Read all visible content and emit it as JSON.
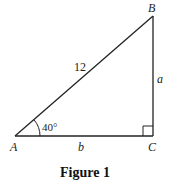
{
  "figure": {
    "caption": "Figure 1",
    "vertices": {
      "A": {
        "label": "A"
      },
      "B": {
        "label": "B"
      },
      "C": {
        "label": "C"
      }
    },
    "sides": {
      "hypotenuse": "12",
      "vertical": "a",
      "horizontal": "b"
    },
    "angle_A": "40°",
    "right_angle_at": "C",
    "colors": {
      "stroke": "#222222",
      "background": "#ffffff"
    }
  }
}
